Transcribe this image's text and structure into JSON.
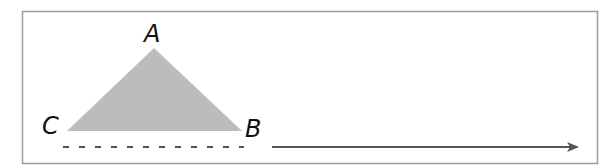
{
  "diagram": {
    "labels": {
      "a": "A",
      "b": "B",
      "c": "C"
    },
    "colors": {
      "frame": "#9a9a9a",
      "triangle_fill": "#bcbcbc",
      "dashed_line": "#555555",
      "arrow": "#555555",
      "label": "#111111"
    },
    "shapes": {
      "triangle": "shaded triangle ABC",
      "dashed_line": "dashed segment under CB",
      "arrow": "rightward arrow"
    }
  }
}
